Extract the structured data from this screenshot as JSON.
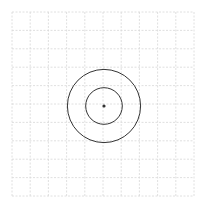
{
  "diagram": {
    "type": "concentric-circles-on-grid",
    "grid": {
      "columns": 10,
      "rows": 10,
      "line_style": "dashed",
      "color": "#d8d8d8"
    },
    "center_point": {
      "color": "#333333"
    },
    "circles": [
      {
        "name": "inner-circle",
        "radius_in_grid_units": 1,
        "color": "#333333"
      },
      {
        "name": "outer-circle",
        "radius_in_grid_units": 2,
        "color": "#333333"
      }
    ]
  }
}
